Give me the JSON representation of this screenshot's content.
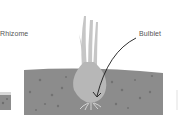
{
  "labels": {
    "left": "Rhizome",
    "right": "Bulblet"
  },
  "colors": {
    "soil": "#8c8c8c",
    "soil_dots": "#6e6e6e",
    "bulb": "#b4b4b4",
    "leaves": "#c4c4c4",
    "roots": "#e2e2e2",
    "arrow": "#1a1a1a",
    "text": "#555555"
  }
}
